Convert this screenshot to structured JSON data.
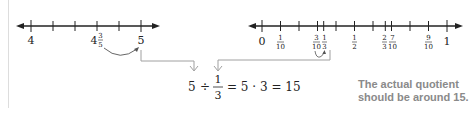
{
  "left_number_line": {
    "start_label": "4",
    "mid_label_whole": "4",
    "mid_label_num": "3",
    "mid_label_den": "5",
    "end_label": "5",
    "tick_count": 6
  },
  "right_number_line": {
    "labels": [
      {
        "type": "whole",
        "text": "0",
        "value": 0
      },
      {
        "type": "frac",
        "num": "1",
        "den": "10",
        "value": 0.1
      },
      {
        "type": "frac",
        "num": "3",
        "den": "10",
        "value": 0.3
      },
      {
        "type": "frac",
        "num": "1",
        "den": "3",
        "value": 0.3333
      },
      {
        "type": "frac",
        "num": "1",
        "den": "2",
        "value": 0.5
      },
      {
        "type": "frac",
        "num": "2",
        "den": "3",
        "value": 0.6667
      },
      {
        "type": "frac",
        "num": "7",
        "den": "10",
        "value": 0.7
      },
      {
        "type": "frac",
        "num": "9",
        "den": "10",
        "value": 0.9
      },
      {
        "type": "whole",
        "text": "1",
        "value": 1
      }
    ]
  },
  "equation": {
    "dividend": "5",
    "div_sign": "÷",
    "frac_num": "1",
    "frac_den": "3",
    "rest": "= 5 · 3 = 15"
  },
  "note": {
    "text": "The actual quotient should be around 15."
  },
  "colors": {
    "line": "#222222",
    "connector": "#a0a0a0",
    "note": "#8a8a8a"
  }
}
